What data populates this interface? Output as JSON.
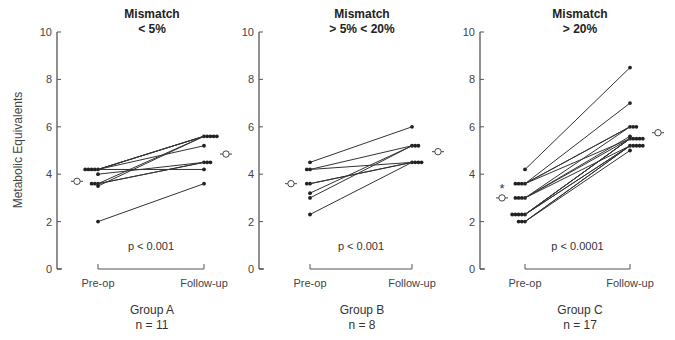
{
  "chart_data": {
    "type": "line",
    "ylabel": "Metabolic Equivalents",
    "ylim": [
      0,
      10
    ],
    "yticks": [
      "0",
      "2",
      "4",
      "6",
      "8",
      "10"
    ],
    "panels": [
      {
        "title_line1": "Mismatch",
        "title_line2": "< 5%",
        "categories": [
          "Pre-op",
          "Follow-up"
        ],
        "group": "Group A",
        "n_label": "n = 11",
        "p_value": "p < 0.001",
        "mean": [
          3.7,
          4.85
        ],
        "mean_significant": false,
        "pairs": [
          [
            4.2,
            5.6
          ],
          [
            4.2,
            5.6
          ],
          [
            4.2,
            5.6
          ],
          [
            4.2,
            5.2
          ],
          [
            4.2,
            4.2
          ],
          [
            4.0,
            4.5
          ],
          [
            3.6,
            5.6
          ],
          [
            3.6,
            4.5
          ],
          [
            3.6,
            4.5
          ],
          [
            3.5,
            5.6
          ],
          [
            2.0,
            3.6
          ]
        ]
      },
      {
        "title_line1": "Mismatch",
        "title_line2": "> 5% < 20%",
        "categories": [
          "Pre-op",
          "Follow-up"
        ],
        "group": "Group B",
        "n_label": "n = 8",
        "p_value": "p < 0.001",
        "mean": [
          3.6,
          4.95
        ],
        "mean_significant": false,
        "pairs": [
          [
            4.5,
            6.0
          ],
          [
            4.2,
            5.2
          ],
          [
            4.2,
            4.5
          ],
          [
            3.6,
            4.5
          ],
          [
            3.6,
            4.5
          ],
          [
            3.2,
            5.2
          ],
          [
            3.0,
            5.2
          ],
          [
            2.3,
            4.5
          ]
        ]
      },
      {
        "title_line1": "Mismatch",
        "title_line2": "> 20%",
        "categories": [
          "Pre-op",
          "Follow-up"
        ],
        "group": "Group C",
        "n_label": "n = 17",
        "p_value": "p < 0.0001",
        "mean": [
          3.0,
          5.75
        ],
        "mean_significant": true,
        "significance_marker": "*",
        "pairs": [
          [
            4.2,
            8.5
          ],
          [
            3.6,
            7.0
          ],
          [
            3.6,
            6.0
          ],
          [
            3.6,
            6.0
          ],
          [
            3.6,
            5.5
          ],
          [
            3.0,
            6.0
          ],
          [
            3.0,
            5.6
          ],
          [
            3.0,
            5.5
          ],
          [
            3.0,
            5.2
          ],
          [
            2.3,
            5.5
          ],
          [
            2.3,
            5.5
          ],
          [
            2.3,
            5.5
          ],
          [
            2.3,
            5.2
          ],
          [
            2.3,
            5.2
          ],
          [
            2.0,
            5.2
          ],
          [
            2.0,
            5.0
          ],
          [
            2.0,
            5.2
          ]
        ]
      }
    ]
  }
}
